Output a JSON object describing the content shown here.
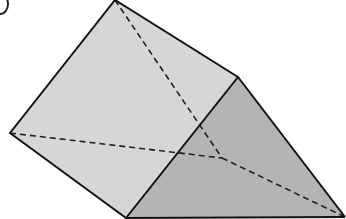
{
  "figure": {
    "type": "triangular-prism",
    "label_partial": "(",
    "colors": {
      "background": "#ffffff",
      "front_face": "#d6d6d6",
      "side_face": "#b4b4b4",
      "edge": "#111111",
      "hidden_edge": "#222222"
    },
    "vertices": {
      "top": [
        115,
        0
      ],
      "left": [
        10,
        133
      ],
      "bottom": [
        126,
        218
      ],
      "right": [
        238,
        77
      ],
      "bottom_right": [
        345,
        217
      ],
      "hidden": [
        222,
        158
      ]
    }
  }
}
